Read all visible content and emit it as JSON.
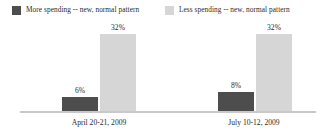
{
  "chart_data": {
    "type": "bar",
    "title": "",
    "subtitle": "",
    "xlabel": "",
    "ylabel": "",
    "ylim": [
      0,
      40
    ],
    "grid": false,
    "legend_position": "top",
    "categories": [
      "April 20-21, 2009",
      "July 10-12, 2009"
    ],
    "series": [
      {
        "name": "More spending -- new, normal pattern",
        "color": "#4d4d4d",
        "values": [
          6,
          8
        ],
        "value_labels": [
          "6%",
          "8%"
        ]
      },
      {
        "name": "Less spending -- new, normal pattern",
        "color": "#d6d6d6",
        "values": [
          32,
          32
        ],
        "value_labels": [
          "32%",
          "32%"
        ]
      }
    ]
  },
  "legend": {
    "items": [
      {
        "label": "More spending -- new, normal pattern",
        "swatch_color": "#4d4d4d"
      },
      {
        "label": "Less spending -- new, normal pattern",
        "swatch_color": "#d6d6d6"
      }
    ]
  },
  "axis": {
    "baseline_color": "#c9c9c9"
  }
}
